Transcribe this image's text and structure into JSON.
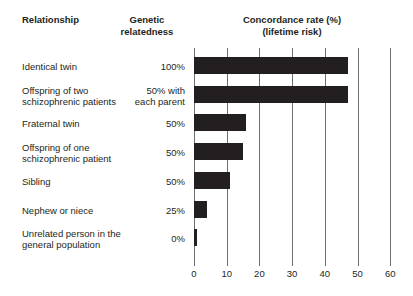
{
  "headers": {
    "relationship": "Relationship",
    "relatedness_line1": "Genetic",
    "relatedness_line2": "relatedness",
    "concordance_line1": "Concordance rate (%)",
    "concordance_line2": "(lifetime risk)"
  },
  "rows": [
    {
      "label_line1": "Identical twin",
      "label_line2": "",
      "relatedness_line1": "100%",
      "relatedness_line2": "",
      "value": 47
    },
    {
      "label_line1": "Offspring of two",
      "label_line2": "schizophrenic patients",
      "relatedness_line1": "50% with",
      "relatedness_line2": "each parent",
      "value": 47
    },
    {
      "label_line1": "Fraternal twin",
      "label_line2": "",
      "relatedness_line1": "50%",
      "relatedness_line2": "",
      "value": 16
    },
    {
      "label_line1": "Offspring of one",
      "label_line2": "schizophrenic patient",
      "relatedness_line1": "50%",
      "relatedness_line2": "",
      "value": 15
    },
    {
      "label_line1": "Sibling",
      "label_line2": "",
      "relatedness_line1": "50%",
      "relatedness_line2": "",
      "value": 11
    },
    {
      "label_line1": "Nephew or niece",
      "label_line2": "",
      "relatedness_line1": "25%",
      "relatedness_line2": "",
      "value": 4
    },
    {
      "label_line1": "Unrelated person in the",
      "label_line2": "general population",
      "relatedness_line1": "0%",
      "relatedness_line2": "",
      "value": 1
    }
  ],
  "axis": {
    "ticks": [
      0,
      10,
      20,
      30,
      40,
      50,
      60
    ],
    "tick_labels": [
      "0",
      "10",
      "20",
      "30",
      "40",
      "50",
      "60"
    ],
    "min": 0,
    "max": 60
  },
  "colors": {
    "bar": "#231f20",
    "gridline": "#6d6e71",
    "text": "#231f20",
    "background": "#ffffff"
  },
  "chart_data": {
    "type": "bar",
    "orientation": "horizontal",
    "title": "Concordance rate (%) (lifetime risk)",
    "subtitle": "(lifetime risk)",
    "xlabel": "Concordance rate (%)",
    "ylabel": "Relationship",
    "categories": [
      "Identical twin",
      "Offspring of two schizophrenic patients",
      "Fraternal twin",
      "Offspring of one schizophrenic patient",
      "Sibling",
      "Nephew or niece",
      "Unrelated person in the general population"
    ],
    "values": [
      47,
      47,
      16,
      15,
      11,
      4,
      1
    ],
    "genetic_relatedness": [
      "100%",
      "50% with each parent",
      "50%",
      "50%",
      "50%",
      "25%",
      "0%"
    ],
    "xlim": [
      0,
      60
    ],
    "xticks": [
      0,
      10,
      20,
      30,
      40,
      50,
      60
    ],
    "grid": "vertical",
    "legend": "none"
  }
}
